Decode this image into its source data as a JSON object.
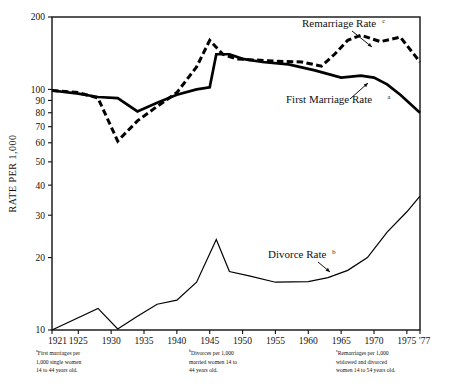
{
  "figure": {
    "axis_title_y": "RATE PER 1,000",
    "plot_frame": {
      "left": 52,
      "top": 17,
      "right": 420,
      "bottom": 330
    }
  },
  "footnotes": [
    {
      "mark": "a",
      "text": "First marriages per\n1,000 single women\n14 to 44 years old."
    },
    {
      "mark": "b",
      "text": "Divorces per 1,000\nmarried women 14 to\n44 years old."
    },
    {
      "mark": "c",
      "text": "Remarriages per 1,000\nwidowed and divorced\nwomen 14 to 54 years old."
    }
  ],
  "chart_data": {
    "type": "line",
    "title": "",
    "xlabel": "",
    "ylabel": "RATE PER 1,000",
    "yscale": "log",
    "ylim": [
      10,
      200
    ],
    "xlim": [
      1921,
      1977
    ],
    "grid": false,
    "legend": "inline-annotations",
    "ytick_values": [
      10,
      20,
      30,
      40,
      50,
      60,
      70,
      80,
      90,
      100,
      200
    ],
    "ytick_labels": [
      "10",
      "20",
      "30",
      "40",
      "50",
      "60",
      "70",
      "80",
      "90",
      "100",
      "200"
    ],
    "xtick_values": [
      1921,
      1925,
      1930,
      1935,
      1940,
      1945,
      1950,
      1955,
      1960,
      1965,
      1970,
      1975,
      1977
    ],
    "xtick_labels": [
      "1921",
      "1925",
      "1930",
      "1935",
      "1940",
      "1945",
      "1950",
      "1955",
      "1960",
      "1965",
      "1970",
      "1975",
      "'77"
    ],
    "series": [
      {
        "name": "First Marriage Rate",
        "mark": "a",
        "style": "solid",
        "color": "#000000",
        "label_x": 1958,
        "label_y": 78,
        "x": [
          1921,
          1925,
          1928,
          1931,
          1934,
          1937,
          1940,
          1943,
          1945,
          1946,
          1948,
          1950,
          1953,
          1957,
          1961,
          1965,
          1968,
          1970,
          1972,
          1974,
          1977
        ],
        "y": [
          99,
          96,
          93,
          92,
          81,
          88,
          95,
          100,
          102,
          140,
          140,
          134,
          130,
          127,
          120,
          112,
          114,
          112,
          105,
          95,
          80
        ]
      },
      {
        "name": "Remarriage Rate",
        "mark": "c",
        "style": "dashed",
        "color": "#000000",
        "label_x": 1951,
        "label_y": 183,
        "x": [
          1921,
          1925,
          1928,
          1931,
          1934,
          1937,
          1940,
          1943,
          1945,
          1947,
          1949,
          1951,
          1955,
          1959,
          1962,
          1964,
          1966,
          1968,
          1971,
          1974,
          1977
        ],
        "y": [
          99,
          97,
          92,
          61,
          74,
          85,
          97,
          124,
          160,
          140,
          134,
          133,
          131,
          130,
          125,
          140,
          160,
          168,
          158,
          165,
          130
        ]
      },
      {
        "name": "Divorce Rate",
        "mark": "b",
        "style": "solid-thin",
        "color": "#000000",
        "label_x": 1958,
        "label_y": 22,
        "x": [
          1921,
          1928,
          1931,
          1934,
          1937,
          1940,
          1943,
          1946,
          1948,
          1951,
          1955,
          1960,
          1963,
          1966,
          1969,
          1972,
          1975,
          1977
        ],
        "y": [
          10.0,
          12.3,
          10.1,
          11.4,
          12.8,
          13.3,
          15.8,
          23.8,
          17.5,
          16.8,
          15.8,
          15.9,
          16.5,
          17.7,
          20.0,
          25.5,
          31.0,
          36.0
        ]
      }
    ],
    "annotations": [
      {
        "text": "Remarriage Rate",
        "mark": "c",
        "points_to": [
          1966,
          163
        ]
      },
      {
        "text": "First Marriage Rate",
        "mark": "a",
        "points_to": [
          1965,
          112
        ]
      },
      {
        "text": "Divorce Rate",
        "mark": "b",
        "points_to": [
          1963,
          16.8
        ]
      }
    ]
  }
}
